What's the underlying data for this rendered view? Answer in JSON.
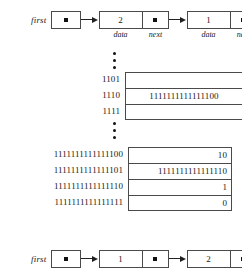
{
  "figure": {
    "kind": "linked-list-memory-diagram",
    "pointer_glyph": "filled-square-dot"
  },
  "top_list": {
    "first_label": "first",
    "nodes": [
      {
        "data": "2",
        "next": "▪",
        "data_label": "data",
        "next_label": "next"
      },
      {
        "data": "1",
        "next": "▪",
        "data_label": "data",
        "next_label": "next"
      }
    ]
  },
  "memory_upper": {
    "rows": [
      {
        "address": "1101",
        "value": ""
      },
      {
        "address": "1110",
        "value": "1111111111111100"
      },
      {
        "address": "1111",
        "value": ""
      }
    ]
  },
  "memory_lower": {
    "rows": [
      {
        "address": "1111111111111100",
        "value": "10"
      },
      {
        "address": "1111111111111101",
        "value": "1111111111111110"
      },
      {
        "address": "1111111111111110",
        "value": "1"
      },
      {
        "address": "1111111111111111",
        "value": "0"
      }
    ]
  },
  "bottom_list": {
    "first_label": "first",
    "nodes": [
      {
        "data": "1",
        "next": "▪"
      },
      {
        "data": "2",
        "next": "▪"
      }
    ]
  }
}
